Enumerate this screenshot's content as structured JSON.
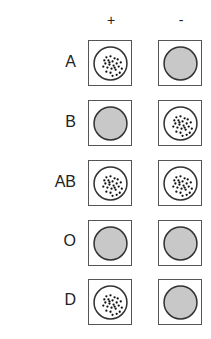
{
  "diagram": {
    "columns": [
      "+",
      "-"
    ],
    "rows": [
      {
        "label": "A",
        "cells": [
          "agglutinated",
          "smooth"
        ]
      },
      {
        "label": "B",
        "cells": [
          "smooth",
          "agglutinated"
        ]
      },
      {
        "label": "AB",
        "cells": [
          "agglutinated",
          "agglutinated"
        ]
      },
      {
        "label": "O",
        "cells": [
          "smooth",
          "smooth"
        ]
      },
      {
        "label": "D",
        "cells": [
          "agglutinated",
          "smooth"
        ]
      }
    ],
    "colors": {
      "smooth_fill": "#c8c8c8",
      "outline": "#333333",
      "dots": "#111111"
    }
  }
}
